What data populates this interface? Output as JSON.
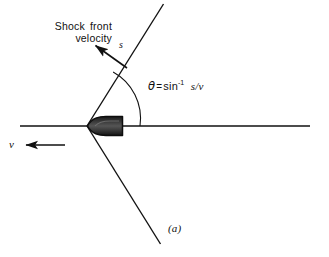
{
  "figure": {
    "panel_label": "(a)",
    "background_color": "#ffffff",
    "stroke_color": "#111111",
    "projectile_fill_color": "#2b2b2b",
    "width": 329,
    "height": 257
  },
  "labels": {
    "shock_front_velocity": "Shock front velocity",
    "shock_speed_symbol": "s",
    "projectile_speed_symbol": "v",
    "angle_symbol": "θ",
    "equals": "=",
    "arcsin_text": "sin",
    "arcsin_exponent": "-1",
    "arcsin_argument": "s/v",
    "equation_plain": "θ = sin⁻¹ s/v"
  },
  "geometry": {
    "vertex": {
      "x": 87,
      "y": 126
    },
    "horizontal_line": {
      "x1": 20,
      "y1": 126,
      "x2": 310,
      "y2": 126
    },
    "upper_shock_line": {
      "x1": 87,
      "y1": 126,
      "x2": 163,
      "y2": 5
    },
    "lower_shock_line": {
      "x1": 87,
      "y1": 126,
      "x2": 160,
      "y2": 243
    },
    "angle_arc_radius": 53,
    "angle_degrees": 58,
    "shock_velocity_arrow": {
      "x1": 127,
      "y1": 68,
      "x2": 92,
      "y2": 43
    },
    "projectile_velocity_arrow": {
      "x1": 65,
      "y1": 145,
      "x2": 22,
      "y2": 145
    },
    "projectile": {
      "nose_x": 87,
      "tail_x": 123,
      "top_y": 117,
      "bottom_y": 135
    }
  },
  "artifact": {
    "bleed_through_text": "    "
  },
  "icons": {
    "shock_velocity_arrowhead": "arrow-up-left-icon",
    "projectile_velocity_arrowhead": "arrow-left-icon"
  }
}
